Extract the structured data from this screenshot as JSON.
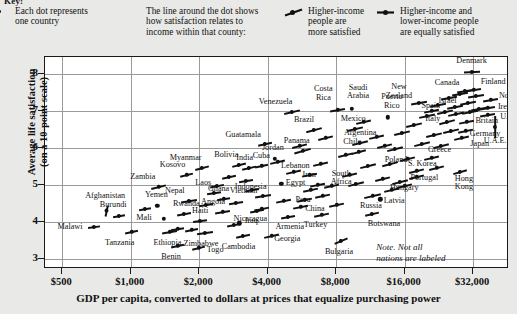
{
  "key": {
    "title": "Key:",
    "items": [
      {
        "icon": "dot-icon",
        "lines": [
          "Each dot represents",
          "one country"
        ]
      },
      {
        "icon": "none",
        "lines": [
          "The line around the dot shows",
          "how satisfaction relates to",
          "income within that county:"
        ]
      },
      {
        "icon": "sloped-dash-dot-icon",
        "lines": [
          "Higher-income",
          "people are",
          "more satisfied"
        ]
      },
      {
        "icon": "flat-dash-dot-icon",
        "lines": [
          "Higher-income and",
          "lower-income people",
          "are equally satisfied"
        ]
      }
    ]
  },
  "note": {
    "line1": "Note. Not all",
    "line2": "nations are labeled"
  },
  "chart_data": {
    "type": "scatter",
    "title": "",
    "xlabel": "GDP per capita, converted to dollars at prices that equalize purchasing power",
    "ylabel_line1": "Average life satisfaction",
    "ylabel_line2": "(on a 10-point scale)",
    "xscale": "log2",
    "xticks": [
      "$500",
      "$1,000",
      "$2,000",
      "$4,000",
      "$8,000",
      "$16,000",
      "$32,000"
    ],
    "xtick_values": [
      500,
      1000,
      2000,
      4000,
      8000,
      16000,
      32000
    ],
    "yticks": [
      "8",
      "7",
      "6",
      "5",
      "4",
      "3"
    ],
    "ytick_values": [
      8,
      7,
      6,
      5,
      4,
      3
    ],
    "xlim": [
      420,
      46000
    ],
    "ylim": [
      2.72,
      8.45
    ],
    "grid": true,
    "legend_position": "top",
    "points": [
      {
        "label": "Afghanistan",
        "x": 780,
        "y": 4.3,
        "slope": 78,
        "len": 11,
        "lx": -1,
        "ly": -15
      },
      {
        "label": "Malawi",
        "x": 690,
        "y": 3.85,
        "slope": 8,
        "len": 12,
        "lx": -24,
        "ly": 0
      },
      {
        "label": "Burundi",
        "x": 890,
        "y": 4.15,
        "slope": 10,
        "len": 12,
        "lx": -6,
        "ly": -11
      },
      {
        "label": "Tanzania",
        "x": 1010,
        "y": 3.72,
        "slope": 12,
        "len": 13,
        "lx": -12,
        "ly": 11
      },
      {
        "label": "Zambia",
        "x": 1330,
        "y": 4.93,
        "slope": 14,
        "len": 15,
        "lx": -16,
        "ly": -10
      },
      {
        "label": "Yemen",
        "x": 1310,
        "y": 4.42,
        "slope": 0,
        "len": 0,
        "lx": -1,
        "ly": -11
      },
      {
        "label": "Mali",
        "x": 1400,
        "y": 4.08,
        "slope": 0,
        "len": 0,
        "lx": -20,
        "ly": -1
      },
      {
        "label": "Ethiopia",
        "x": 1480,
        "y": 3.72,
        "slope": 10,
        "len": 15,
        "lx": -2,
        "ly": 11
      },
      {
        "label": "Benin",
        "x": 1600,
        "y": 3.35,
        "slope": 12,
        "len": 13,
        "lx": -6,
        "ly": 11
      },
      {
        "label": "Rwanda",
        "x": 1720,
        "y": 4.22,
        "slope": 10,
        "len": 14,
        "lx": 2,
        "ly": -10
      },
      {
        "label": "Kosovo",
        "x": 1760,
        "y": 5.26,
        "slope": 14,
        "len": 13,
        "lx": -14,
        "ly": -10
      },
      {
        "label": "Nepal",
        "x": 1800,
        "y": 4.55,
        "slope": 9,
        "len": 16,
        "lx": -14,
        "ly": -10
      },
      {
        "label": "Myanmar",
        "x": 2050,
        "y": 5.45,
        "slope": 15,
        "len": 14,
        "lx": -16,
        "ly": -10
      },
      {
        "label": "Togo",
        "x": 1980,
        "y": 3.3,
        "slope": 14,
        "len": 13,
        "lx": 17,
        "ly": 2
      },
      {
        "label": "Haiti",
        "x": 2020,
        "y": 4.02,
        "slope": 7,
        "len": 14,
        "lx": 0,
        "ly": -10
      },
      {
        "label": "Zimbabwe",
        "x": 2120,
        "y": 3.68,
        "slope": 8,
        "len": 16,
        "lx": -4,
        "ly": 11
      },
      {
        "label": "Laos",
        "x": 2330,
        "y": 4.78,
        "slope": 8,
        "len": 14,
        "lx": -11,
        "ly": -10
      },
      {
        "label": "Angola",
        "x": 2520,
        "y": 4.25,
        "slope": 10,
        "len": 15,
        "lx": -9,
        "ly": -10
      },
      {
        "label": "Ghana",
        "x": 2560,
        "y": 4.62,
        "slope": 9,
        "len": 13,
        "lx": -5,
        "ly": -10
      },
      {
        "label": "Bolivia",
        "x": 3000,
        "y": 5.52,
        "slope": 14,
        "len": 14,
        "lx": -13,
        "ly": -10
      },
      {
        "label": "India",
        "x": 3300,
        "y": 5.45,
        "slope": 13,
        "len": 14,
        "lx": -4,
        "ly": -10
      },
      {
        "label": "Cuba",
        "x": 3750,
        "y": 5.5,
        "slope": 12,
        "len": 13,
        "lx": 0,
        "ly": -10
      },
      {
        "label": "Guatamala",
        "x": 3900,
        "y": 6.1,
        "slope": 12,
        "len": 14,
        "lx": -22,
        "ly": -9
      },
      {
        "label": "Vietnam",
        "x": 3200,
        "y": 5.1,
        "slope": 9,
        "len": 14,
        "lx": -2,
        "ly": 10
      },
      {
        "label": "Cambodia",
        "x": 3100,
        "y": 3.62,
        "slope": 12,
        "len": 14,
        "lx": -4,
        "ly": 11
      },
      {
        "label": "Iraq",
        "x": 3000,
        "y": 3.95,
        "slope": 0,
        "len": 0,
        "lx": 12,
        "ly": -2
      },
      {
        "label": "Indonesia",
        "x": 3800,
        "y": 4.68,
        "slope": 9,
        "len": 16,
        "lx": -12,
        "ly": -9
      },
      {
        "label": "Nicaragua",
        "x": 3750,
        "y": 4.35,
        "slope": 12,
        "len": 15,
        "lx": -11,
        "ly": 10
      },
      {
        "label": "Georgia",
        "x": 4150,
        "y": 3.62,
        "slope": 13,
        "len": 15,
        "lx": 16,
        "ly": 3
      },
      {
        "label": "Egypt",
        "x": 4600,
        "y": 5.02,
        "slope": 0,
        "len": 0,
        "lx": 14,
        "ly": -1
      },
      {
        "label": "Armenia",
        "x": 4900,
        "y": 4.12,
        "slope": 10,
        "len": 14,
        "lx": 2,
        "ly": 10
      },
      {
        "label": "Jordan",
        "x": 4300,
        "y": 5.7,
        "slope": 0,
        "len": 0,
        "lx": -2,
        "ly": -11
      },
      {
        "label": "Venezuela",
        "x": 5100,
        "y": 6.95,
        "slope": 13,
        "len": 16,
        "lx": -16,
        "ly": -10
      },
      {
        "label": "Panama",
        "x": 5700,
        "y": 5.92,
        "slope": 16,
        "len": 17,
        "lx": -6,
        "ly": -10
      },
      {
        "label": "Brazil",
        "x": 6400,
        "y": 6.48,
        "slope": 15,
        "len": 16,
        "lx": -10,
        "ly": -10
      },
      {
        "label": "Lebanon",
        "x": 6100,
        "y": 5.25,
        "slope": 11,
        "len": 15,
        "lx": -14,
        "ly": -9
      },
      {
        "label": "Iran",
        "x": 6600,
        "y": 5.0,
        "slope": 11,
        "len": 15,
        "lx": -8,
        "ly": -10
      },
      {
        "label": "Peru",
        "x": 6200,
        "y": 4.85,
        "slope": 12,
        "len": 15,
        "lx": -8,
        "ly": 10
      },
      {
        "label": "China",
        "x": 5600,
        "y": 4.4,
        "slope": 11,
        "len": 15,
        "lx": 14,
        "ly": 2
      },
      {
        "label": "Turkey",
        "x": 6900,
        "y": 4.18,
        "slope": 12,
        "len": 15,
        "lx": -6,
        "ly": 10
      },
      {
        "label": "Bulgaria",
        "x": 8400,
        "y": 3.48,
        "slope": 23,
        "len": 14,
        "lx": -2,
        "ly": 11
      },
      {
        "label": "Costa Rica",
        "x": 8100,
        "y": 7.02,
        "slope": 10,
        "len": 15,
        "lx": -14,
        "ly": -16
      },
      {
        "label": "Saudi Arabia",
        "x": 9400,
        "y": 7.05,
        "slope": 0,
        "len": 0,
        "lx": 6,
        "ly": -16
      },
      {
        "label": "Mexico",
        "x": 9700,
        "y": 6.5,
        "slope": 13,
        "len": 16,
        "lx": -2,
        "ly": -10
      },
      {
        "label": "Argentina",
        "x": 10200,
        "y": 6.12,
        "slope": 14,
        "len": 16,
        "lx": 0,
        "ly": -10
      },
      {
        "label": "Chile",
        "x": 10000,
        "y": 5.88,
        "slope": 15,
        "len": 15,
        "lx": -6,
        "ly": -10
      },
      {
        "label": "South Africa",
        "x": 9800,
        "y": 5.02,
        "slope": 14,
        "len": 16,
        "lx": -15,
        "ly": -5
      },
      {
        "label": "Russia",
        "x": 11600,
        "y": 4.68,
        "slope": 13,
        "len": 17,
        "lx": -2,
        "ly": 10
      },
      {
        "label": "Botswana",
        "x": 11500,
        "y": 4.2,
        "slope": 13,
        "len": 14,
        "lx": 12,
        "ly": 10
      },
      {
        "label": "Puerto Rico",
        "x": 13500,
        "y": 6.82,
        "slope": 0,
        "len": 0,
        "lx": 4,
        "ly": -15
      },
      {
        "label": "New Zealand",
        "x": 18500,
        "y": 7.2,
        "slope": 10,
        "len": 16,
        "lx": -20,
        "ly": -11
      },
      {
        "label": "Israel",
        "x": 21000,
        "y": 7.0,
        "slope": 11,
        "len": 15,
        "lx": 16,
        "ly": -10
      },
      {
        "label": "Poland",
        "x": 13800,
        "y": 5.55,
        "slope": 15,
        "len": 16,
        "lx": 6,
        "ly": -4
      },
      {
        "label": "Latvia",
        "x": 12500,
        "y": 4.6,
        "slope": 0,
        "len": 0,
        "lx": 14,
        "ly": 2
      },
      {
        "label": "S. Korea",
        "x": 18000,
        "y": 5.38,
        "slope": 14,
        "len": 15,
        "lx": 6,
        "ly": -7
      },
      {
        "label": "Hungary",
        "x": 15300,
        "y": 5.08,
        "slope": 14,
        "len": 16,
        "lx": 4,
        "ly": 6
      },
      {
        "label": "Portugal",
        "x": 18000,
        "y": 5.2,
        "slope": 14,
        "len": 15,
        "lx": 8,
        "ly": 1
      },
      {
        "label": "Greece",
        "x": 21000,
        "y": 5.72,
        "slope": 13,
        "len": 15,
        "lx": 8,
        "ly": -8
      },
      {
        "label": "Hong Kong",
        "x": 28000,
        "y": 5.35,
        "slope": 16,
        "len": 14,
        "lx": 4,
        "ly": 12
      },
      {
        "label": "Spain",
        "x": 24000,
        "y": 6.95,
        "slope": 13,
        "len": 16,
        "lx": -14,
        "ly": -6
      },
      {
        "label": "Italy",
        "x": 24500,
        "y": 6.68,
        "slope": 15,
        "len": 16,
        "lx": -14,
        "ly": -3
      },
      {
        "label": "Canada",
        "x": 29500,
        "y": 7.52,
        "slope": 9,
        "len": 16,
        "lx": -18,
        "ly": -8
      },
      {
        "label": "Finland",
        "x": 32000,
        "y": 7.55,
        "slope": 9,
        "len": 15,
        "lx": 20,
        "ly": -8
      },
      {
        "label": "Denmark",
        "x": 31500,
        "y": 8.05,
        "slope": 3,
        "len": 16,
        "lx": 0,
        "ly": -11
      },
      {
        "label": "Norway",
        "x": 38000,
        "y": 7.3,
        "slope": 10,
        "len": 15,
        "lx": 22,
        "ly": -4
      },
      {
        "label": "Ireland",
        "x": 37000,
        "y": 7.08,
        "slope": 10,
        "len": 15,
        "lx": 22,
        "ly": -1
      },
      {
        "label": "U.S.",
        "x": 37000,
        "y": 6.88,
        "slope": 10,
        "len": 15,
        "lx": 20,
        "ly": 2
      },
      {
        "label": "Britain",
        "x": 30000,
        "y": 6.7,
        "slope": 11,
        "len": 15,
        "lx": 20,
        "ly": -1
      },
      {
        "label": "Germany",
        "x": 29500,
        "y": 6.45,
        "slope": 12,
        "len": 15,
        "lx": 20,
        "ly": 3
      },
      {
        "label": "Japan",
        "x": 28500,
        "y": 6.25,
        "slope": 13,
        "len": 15,
        "lx": 18,
        "ly": 6
      },
      {
        "label": "U.A.E.",
        "x": 40000,
        "y": 6.55,
        "slope": 90,
        "len": 22,
        "lx": 0,
        "ly": 14
      }
    ],
    "unlabeled_points": [
      {
        "x": 1150,
        "y": 4.35,
        "slope": 10,
        "len": 12
      },
      {
        "x": 1600,
        "y": 3.8,
        "slope": 9,
        "len": 13
      },
      {
        "x": 1850,
        "y": 3.78,
        "slope": 11,
        "len": 13
      },
      {
        "x": 2150,
        "y": 4.45,
        "slope": 9,
        "len": 14
      },
      {
        "x": 2400,
        "y": 4.95,
        "slope": 11,
        "len": 14
      },
      {
        "x": 2700,
        "y": 5.2,
        "slope": 12,
        "len": 14
      },
      {
        "x": 2850,
        "y": 3.9,
        "slope": 11,
        "len": 14
      },
      {
        "x": 2900,
        "y": 4.5,
        "slope": 9,
        "len": 14
      },
      {
        "x": 3400,
        "y": 4.85,
        "slope": 10,
        "len": 14
      },
      {
        "x": 3600,
        "y": 4.28,
        "slope": 11,
        "len": 14
      },
      {
        "x": 4400,
        "y": 5.6,
        "slope": 13,
        "len": 15
      },
      {
        "x": 4700,
        "y": 4.55,
        "slope": 11,
        "len": 15
      },
      {
        "x": 5200,
        "y": 5.35,
        "slope": 13,
        "len": 15
      },
      {
        "x": 5500,
        "y": 6.05,
        "slope": 14,
        "len": 15
      },
      {
        "x": 5800,
        "y": 4.58,
        "slope": 12,
        "len": 15
      },
      {
        "x": 6800,
        "y": 5.55,
        "slope": 13,
        "len": 15
      },
      {
        "x": 7200,
        "y": 6.25,
        "slope": 14,
        "len": 15
      },
      {
        "x": 7600,
        "y": 4.95,
        "slope": 12,
        "len": 15
      },
      {
        "x": 8800,
        "y": 5.8,
        "slope": 14,
        "len": 15
      },
      {
        "x": 9200,
        "y": 5.25,
        "slope": 13,
        "len": 15
      },
      {
        "x": 10500,
        "y": 6.7,
        "slope": 13,
        "len": 15
      },
      {
        "x": 11000,
        "y": 5.5,
        "slope": 14,
        "len": 16
      },
      {
        "x": 12000,
        "y": 6.3,
        "slope": 13,
        "len": 15
      },
      {
        "x": 12800,
        "y": 5.15,
        "slope": 14,
        "len": 15
      },
      {
        "x": 13000,
        "y": 6.05,
        "slope": 14,
        "len": 15
      },
      {
        "x": 14500,
        "y": 5.95,
        "slope": 14,
        "len": 16
      },
      {
        "x": 15500,
        "y": 6.4,
        "slope": 13,
        "len": 16
      },
      {
        "x": 16500,
        "y": 5.7,
        "slope": 14,
        "len": 15
      },
      {
        "x": 17500,
        "y": 6.6,
        "slope": 13,
        "len": 16
      },
      {
        "x": 19000,
        "y": 6.1,
        "slope": 14,
        "len": 16
      },
      {
        "x": 20000,
        "y": 6.85,
        "slope": 12,
        "len": 16
      },
      {
        "x": 21500,
        "y": 6.35,
        "slope": 13,
        "len": 16
      },
      {
        "x": 22500,
        "y": 7.15,
        "slope": 11,
        "len": 16
      },
      {
        "x": 23000,
        "y": 6.05,
        "slope": 14,
        "len": 16
      },
      {
        "x": 25000,
        "y": 7.35,
        "slope": 10,
        "len": 16
      },
      {
        "x": 25500,
        "y": 6.45,
        "slope": 13,
        "len": 16
      },
      {
        "x": 26500,
        "y": 7.1,
        "slope": 11,
        "len": 16
      },
      {
        "x": 27000,
        "y": 6.9,
        "slope": 12,
        "len": 16
      },
      {
        "x": 28000,
        "y": 7.45,
        "slope": 10,
        "len": 16
      },
      {
        "x": 30500,
        "y": 7.2,
        "slope": 11,
        "len": 16
      },
      {
        "x": 31000,
        "y": 6.95,
        "slope": 11,
        "len": 16
      },
      {
        "x": 33000,
        "y": 7.4,
        "slope": 9,
        "len": 16
      },
      {
        "x": 34000,
        "y": 7.05,
        "slope": 10,
        "len": 16
      },
      {
        "x": 22000,
        "y": 5.45,
        "slope": 14,
        "len": 15
      },
      {
        "x": 16000,
        "y": 4.95,
        "slope": 14,
        "len": 15
      },
      {
        "x": 14000,
        "y": 4.85,
        "slope": 13,
        "len": 15
      },
      {
        "x": 8000,
        "y": 4.45,
        "slope": 12,
        "len": 15
      },
      {
        "x": 7000,
        "y": 4.7,
        "slope": 12,
        "len": 15
      }
    ]
  }
}
